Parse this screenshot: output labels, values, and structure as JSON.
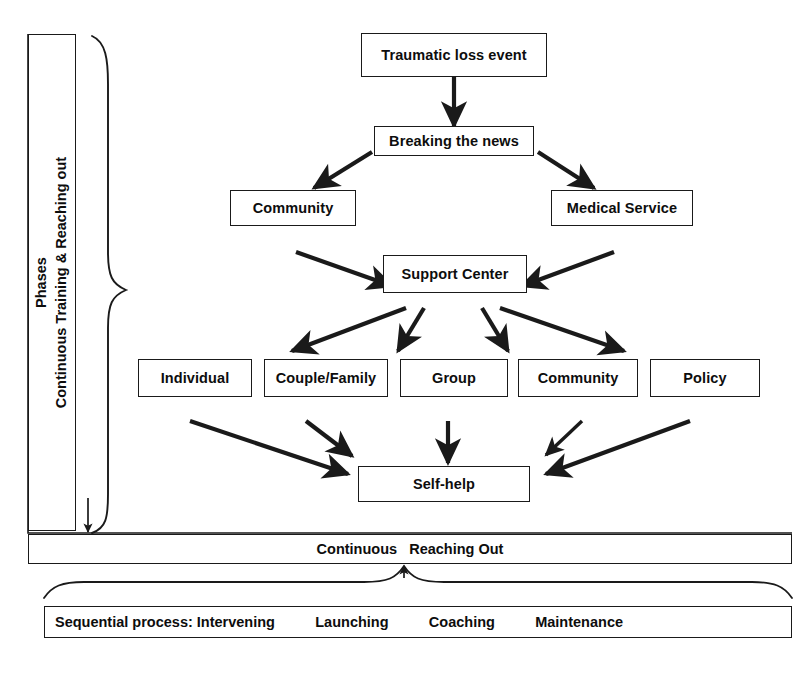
{
  "figure": {
    "line_color": "#1a1a1a",
    "fill_color": "#ffffff",
    "text_color": "#0d0d0d"
  },
  "side_axis": {
    "label_line1": "Phases",
    "label_line2": "Continuous Training & Reaching out"
  },
  "nodes": {
    "traumatic_loss_event": "Traumatic loss event",
    "breaking_the_news": "Breaking the news",
    "community_top": "Community",
    "medical_service": "Medical Service",
    "support_center": "Support Center",
    "individual": "Individual",
    "couple_family": "Couple/Family",
    "group": "Group",
    "community_bottom": "Community",
    "policy": "Policy",
    "self_help": "Self-help"
  },
  "bars": {
    "continuous_reaching_out": "Continuous   Reaching Out",
    "sequential_process": "Sequential process: Intervening          Launching          Coaching          Maintenance"
  },
  "sequential_stages": [
    "Intervening",
    "Launching",
    "Coaching",
    "Maintenance"
  ],
  "flows": [
    {
      "from": "traumatic_loss_event",
      "to": "breaking_the_news"
    },
    {
      "from": "breaking_the_news",
      "to": "community_top"
    },
    {
      "from": "breaking_the_news",
      "to": "medical_service"
    },
    {
      "from": "community_top",
      "to": "support_center"
    },
    {
      "from": "medical_service",
      "to": "support_center"
    },
    {
      "from": "support_center",
      "to": "couple_family"
    },
    {
      "from": "support_center",
      "to": "group"
    },
    {
      "from": "support_center",
      "to": "community_bottom"
    },
    {
      "from": "support_center",
      "to": "policy"
    },
    {
      "from": "individual",
      "to": "self_help"
    },
    {
      "from": "couple_family",
      "to": "self_help"
    },
    {
      "from": "group",
      "to": "self_help"
    },
    {
      "from": "community_bottom",
      "to": "self_help"
    },
    {
      "from": "policy",
      "to": "self_help"
    }
  ],
  "caption": ""
}
